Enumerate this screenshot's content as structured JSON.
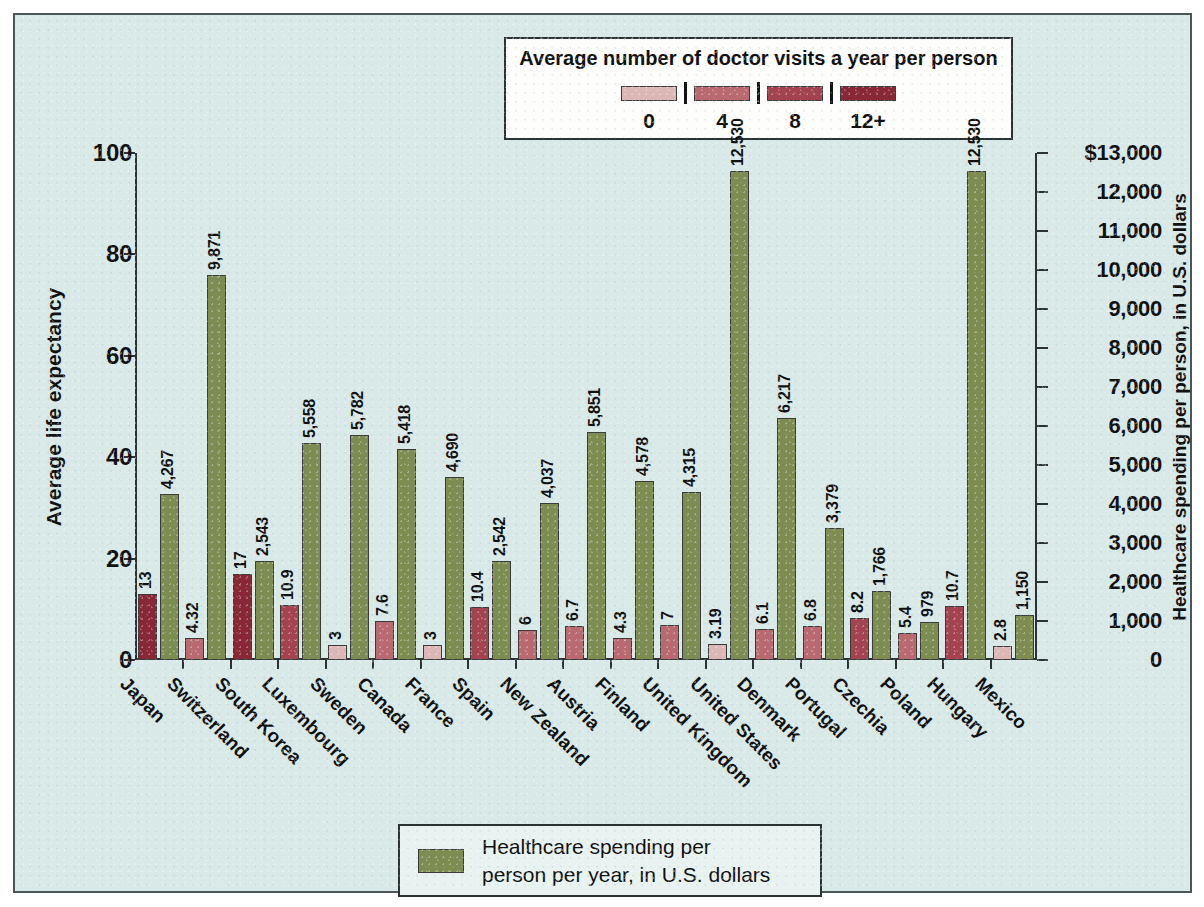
{
  "chart_data": {
    "type": "bar",
    "title": "",
    "orientation": "vertical",
    "grid": false,
    "categories": [
      "Japan",
      "Switzerland",
      "South Korea",
      "Luxembourg",
      "Sweden",
      "Canada",
      "France",
      "Spain",
      "New Zealand",
      "Austria",
      "Finland",
      "United Kingdom",
      "United States",
      "Denmark",
      "Portugal",
      "Czechia",
      "Poland",
      "Hungary",
      "Mexico"
    ],
    "series": [
      {
        "name": "Average number of doctor visits a year per person",
        "axis": "left",
        "unit": "visits per year",
        "values": [
          13,
          4.32,
          17,
          10.9,
          3,
          7.6,
          3,
          10.4,
          6,
          6.7,
          4.3,
          7,
          3.19,
          6.1,
          6.8,
          8.2,
          5.4,
          10.7,
          2.8
        ],
        "labels": [
          "13",
          "4.32",
          "17",
          "10.9",
          "3",
          "7.6",
          "3",
          "10.4",
          "6",
          "6.7",
          "4.3",
          "7",
          "3.19",
          "6.1",
          "6.8",
          "8.2",
          "5.4",
          "10.7",
          "2.8"
        ]
      },
      {
        "name": "Healthcare spending per person per year, in U.S. dollars",
        "axis": "right",
        "unit": "U.S. dollars",
        "color": "#7d8c50",
        "values": [
          4267,
          9871,
          2543,
          5558,
          5782,
          5418,
          4690,
          2542,
          4037,
          5851,
          4578,
          4315,
          12530,
          6217,
          3379,
          1766,
          979,
          12530,
          1150
        ],
        "labels": [
          "4,267",
          "9,871",
          "2,543",
          "5,558",
          "5,782",
          "5,418",
          "4,690",
          "2,542",
          "4,037",
          "5,851",
          "4,578",
          "4,315",
          "12,530",
          "6,217",
          "3,379",
          "1,766",
          "979",
          "12,530",
          "1,150"
        ]
      }
    ],
    "left_axis": {
      "label": "Average life expectancy",
      "ticks": [
        "0",
        "20",
        "40",
        "60",
        "80",
        "100"
      ],
      "tick_values": [
        0,
        20,
        40,
        60,
        80,
        100
      ],
      "ylim": [
        0,
        100
      ]
    },
    "right_axis": {
      "label": "Healthcare spending per person, in U.S. dollars",
      "ticks": [
        "0",
        "1,000",
        "2,000",
        "3,000",
        "4,000",
        "5,000",
        "6,000",
        "7,000",
        "8,000",
        "9,000",
        "10,000",
        "11,000",
        "12,000",
        "$13,000"
      ],
      "tick_values": [
        0,
        1000,
        2000,
        3000,
        4000,
        5000,
        6000,
        7000,
        8000,
        9000,
        10000,
        11000,
        12000,
        13000
      ],
      "ylim": [
        0,
        13000
      ]
    },
    "xlabel": "",
    "legend_position": "top-center and bottom-center"
  },
  "legend_top": {
    "title": "Average number of doctor visits a year per person",
    "ticks": [
      "0",
      "4",
      "8",
      "12+"
    ],
    "swatch_colors": [
      "#ddb6b6",
      "#b9696f",
      "#a4434f",
      "#8a2736"
    ]
  },
  "legend_bottom": {
    "color": "#7d8c50",
    "line1": "Healthcare spending per",
    "line2": "person per year, in U.S. dollars"
  },
  "theme": {
    "background": "#d8e9e8",
    "frame_border": "#4a5658",
    "axis": "#2a3234",
    "text": "#111111",
    "spend_bar": "#7d8c50"
  }
}
